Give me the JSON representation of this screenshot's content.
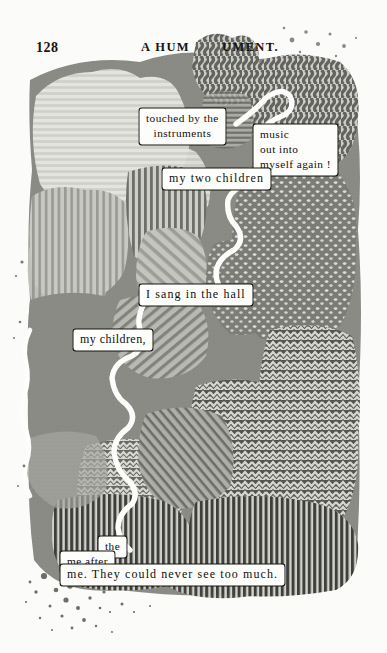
{
  "page": {
    "folio": "128",
    "running_head_left": "A HUM",
    "running_head_right": "UMENT.",
    "background_color": "#fbfbf9",
    "ink_color": "#15140f"
  },
  "windows": [
    {
      "id": "touched",
      "line1": "touched by the",
      "line2": "instruments"
    },
    {
      "id": "music",
      "line1": "music",
      "line2": "out into",
      "line3": "myself again !"
    },
    {
      "id": "two",
      "text": "my two children"
    },
    {
      "id": "sang",
      "text": "I  sang  in  the  hall"
    },
    {
      "id": "mychildren",
      "text": "my children,"
    },
    {
      "id": "the",
      "text": "the"
    },
    {
      "id": "meafter",
      "text": "me after"
    },
    {
      "id": "never",
      "text": "me.    They could  never  see  too  much."
    }
  ],
  "text_windows": {
    "touched": {
      "line1": "touched by the",
      "line2": "instruments"
    },
    "music": {
      "line1": "music",
      "line2": "out into",
      "line3": "myself again !"
    },
    "two": {
      "text": "my two children"
    },
    "sang": {
      "text": "I  sang  in  the  hall"
    },
    "mychildren": {
      "text": "my children,"
    },
    "the": {
      "text": "the"
    },
    "meafter": {
      "text": "me after"
    },
    "never": {
      "text": "me.    They could  never  see  too  much."
    }
  },
  "collage": {
    "palette": {
      "paper": "#fbfbf9",
      "pale_gray": "#d3d3cf",
      "light_gray": "#bdbdb8",
      "mid_gray": "#8d8d88",
      "gray": "#7b7b76",
      "dark_gray": "#5b5b57",
      "darkest": "#3b3b38"
    },
    "textures": [
      "horizontal-stripes",
      "vertical-stripes",
      "diagonal-stripes",
      "wavy-vertical",
      "zigzag",
      "dots",
      "flat-gray",
      "speckle"
    ]
  }
}
